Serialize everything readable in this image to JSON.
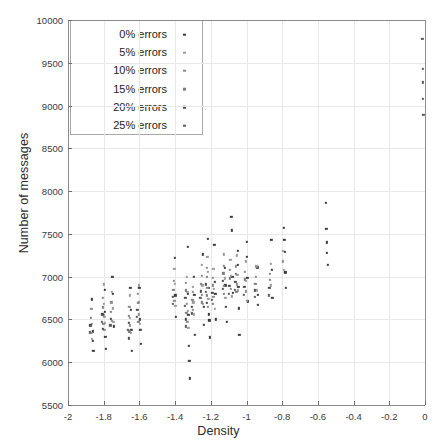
{
  "chart_data": {
    "type": "scatter",
    "title": "",
    "xlabel": "Density",
    "ylabel": "Number of messages",
    "xlim": [
      -2,
      0
    ],
    "ylim": [
      5500,
      10000
    ],
    "xticks": [
      "-2",
      "-1.8",
      "-1.6",
      "-1.4",
      "-1.2",
      "-1",
      "-0.8",
      "-0.6",
      "-0.4",
      "-0.2",
      "0"
    ],
    "xtick_values": [
      -2,
      -1.8,
      -1.6,
      -1.4,
      -1.2,
      -1,
      -0.8,
      -0.6,
      -0.4,
      -0.2,
      0
    ],
    "yticks": [
      "5500",
      "6000",
      "6500",
      "7000",
      "7500",
      "8000",
      "8500",
      "9000",
      "9500",
      "10000"
    ],
    "ytick_values": [
      5500,
      6000,
      6500,
      7000,
      7500,
      8000,
      8500,
      9000,
      9500,
      10000
    ],
    "grid": true,
    "legend_position": "upper-left",
    "legend_entries": [
      {
        "label": "0% errors",
        "color": "#3b3b3b"
      },
      {
        "label": "5% errors",
        "color": "#9a9a9a"
      },
      {
        "label": "10% errors",
        "color": "#8a8a8a"
      },
      {
        "label": "15% errors",
        "color": "#7d7d7d"
      },
      {
        "label": "20% errors",
        "color": "#4a4a4a"
      },
      {
        "label": "25% errors",
        "color": "#5a5a5a"
      }
    ],
    "series": [
      {
        "name": "0% errors",
        "color": "#3b3b3b",
        "points": [
          [
            -1.865,
            6735
          ],
          [
            -1.862,
            6360
          ],
          [
            -1.86,
            6250
          ],
          [
            -1.858,
            6130
          ],
          [
            -1.795,
            6845
          ],
          [
            -1.792,
            6590
          ],
          [
            -1.79,
            6300
          ],
          [
            -1.788,
            6155
          ],
          [
            -1.752,
            7000
          ],
          [
            -1.748,
            6800
          ],
          [
            -1.745,
            6420
          ],
          [
            -1.65,
            6870
          ],
          [
            -1.648,
            6610
          ],
          [
            -1.645,
            6380
          ],
          [
            -1.642,
            6130
          ],
          [
            -1.6,
            6870
          ],
          [
            -1.598,
            6500
          ],
          [
            -1.595,
            6380
          ],
          [
            -1.592,
            6215
          ],
          [
            -1.4,
            7220
          ],
          [
            -1.398,
            6780
          ],
          [
            -1.395,
            6530
          ],
          [
            -1.33,
            7350
          ],
          [
            -1.328,
            6800
          ],
          [
            -1.325,
            6550
          ],
          [
            -1.322,
            6195
          ],
          [
            -1.32,
            6020
          ],
          [
            -1.318,
            5810
          ],
          [
            -1.295,
            7000
          ],
          [
            -1.292,
            6790
          ],
          [
            -1.29,
            6320
          ],
          [
            -1.245,
            7260
          ],
          [
            -1.24,
            6650
          ],
          [
            -1.238,
            6440
          ],
          [
            -1.215,
            7440
          ],
          [
            -1.212,
            6870
          ],
          [
            -1.21,
            6560
          ],
          [
            -1.208,
            6490
          ],
          [
            -1.205,
            6290
          ],
          [
            -1.18,
            7370
          ],
          [
            -1.178,
            6940
          ],
          [
            -1.175,
            6800
          ],
          [
            -1.172,
            6500
          ],
          [
            -1.12,
            7100
          ],
          [
            -1.118,
            6900
          ],
          [
            -1.115,
            6650
          ],
          [
            -1.112,
            6470
          ],
          [
            -1.085,
            7700
          ],
          [
            -1.082,
            7540
          ],
          [
            -1.08,
            7000
          ],
          [
            -1.078,
            6810
          ],
          [
            -1.05,
            7300
          ],
          [
            -1.048,
            7140
          ],
          [
            -1.045,
            6880
          ],
          [
            -1.042,
            6630
          ],
          [
            -1.04,
            6320
          ],
          [
            -1.0,
            7410
          ],
          [
            -0.998,
            7230
          ],
          [
            -0.995,
            6990
          ],
          [
            -0.992,
            6710
          ],
          [
            -0.94,
            7110
          ],
          [
            -0.938,
            6790
          ],
          [
            -0.935,
            6670
          ],
          [
            -0.86,
            7430
          ],
          [
            -0.858,
            7080
          ],
          [
            -0.855,
            6750
          ],
          [
            -0.79,
            7570
          ],
          [
            -0.788,
            7430
          ],
          [
            -0.785,
            7290
          ],
          [
            -0.782,
            7050
          ],
          [
            -0.78,
            6870
          ],
          [
            -0.555,
            7860
          ],
          [
            -0.552,
            7560
          ],
          [
            -0.55,
            7400
          ],
          [
            -0.548,
            7280
          ],
          [
            -0.545,
            7140
          ]
        ]
      },
      {
        "name": "5% errors",
        "color": "#9a9a9a",
        "points": [
          [
            -1.868,
            6450
          ],
          [
            -1.866,
            6270
          ],
          [
            -1.8,
            6910
          ],
          [
            -1.798,
            6680
          ],
          [
            -1.796,
            6530
          ],
          [
            -1.794,
            6460
          ],
          [
            -1.755,
            6820
          ],
          [
            -1.75,
            6630
          ],
          [
            -1.746,
            6470
          ],
          [
            -1.655,
            6780
          ],
          [
            -1.652,
            6520
          ],
          [
            -1.649,
            6340
          ],
          [
            -1.605,
            6900
          ],
          [
            -1.602,
            6700
          ],
          [
            -1.599,
            6450
          ],
          [
            -1.405,
            7090
          ],
          [
            -1.402,
            6920
          ],
          [
            -1.399,
            6660
          ],
          [
            -1.335,
            7000
          ],
          [
            -1.332,
            6820
          ],
          [
            -1.329,
            6600
          ],
          [
            -1.326,
            6400
          ],
          [
            -1.3,
            6880
          ],
          [
            -1.297,
            6700
          ],
          [
            -1.294,
            6560
          ],
          [
            -1.25,
            7140
          ],
          [
            -1.247,
            6900
          ],
          [
            -1.244,
            6680
          ],
          [
            -1.22,
            7230
          ],
          [
            -1.217,
            7060
          ],
          [
            -1.214,
            6740
          ],
          [
            -1.185,
            7090
          ],
          [
            -1.182,
            6860
          ],
          [
            -1.179,
            6620
          ],
          [
            -1.125,
            7260
          ],
          [
            -1.122,
            6980
          ],
          [
            -1.119,
            6750
          ],
          [
            -1.09,
            7200
          ],
          [
            -1.087,
            7010
          ],
          [
            -1.084,
            6770
          ],
          [
            -1.055,
            7250
          ],
          [
            -1.052,
            7020
          ],
          [
            -1.049,
            6840
          ],
          [
            -1.005,
            7180
          ],
          [
            -1.002,
            6950
          ],
          [
            -0.999,
            6720
          ],
          [
            -0.945,
            7120
          ],
          [
            -0.942,
            6840
          ],
          [
            -0.865,
            7150
          ],
          [
            -0.862,
            6900
          ],
          [
            -0.795,
            7300
          ],
          [
            -0.792,
            7080
          ]
        ]
      },
      {
        "name": "10% errors",
        "color": "#8a8a8a",
        "points": [
          [
            -1.87,
            6620
          ],
          [
            -1.867,
            6340
          ],
          [
            -1.803,
            6750
          ],
          [
            -1.8,
            6550
          ],
          [
            -1.797,
            6380
          ],
          [
            -1.757,
            6700
          ],
          [
            -1.753,
            6480
          ],
          [
            -1.657,
            6650
          ],
          [
            -1.654,
            6430
          ],
          [
            -1.607,
            6800
          ],
          [
            -1.604,
            6560
          ],
          [
            -1.408,
            6950
          ],
          [
            -1.405,
            6720
          ],
          [
            -1.338,
            6930
          ],
          [
            -1.335,
            6680
          ],
          [
            -1.331,
            6470
          ],
          [
            -1.302,
            6820
          ],
          [
            -1.299,
            6610
          ],
          [
            -1.252,
            7010
          ],
          [
            -1.249,
            6790
          ],
          [
            -1.222,
            7100
          ],
          [
            -1.219,
            6870
          ],
          [
            -1.216,
            6650
          ],
          [
            -1.188,
            6990
          ],
          [
            -1.185,
            6760
          ],
          [
            -1.128,
            7130
          ],
          [
            -1.125,
            6890
          ],
          [
            -1.092,
            7080
          ],
          [
            -1.089,
            6860
          ],
          [
            -1.058,
            7120
          ],
          [
            -1.055,
            6910
          ],
          [
            -1.008,
            7060
          ],
          [
            -1.005,
            6830
          ],
          [
            -0.948,
            7000
          ],
          [
            -0.868,
            7030
          ],
          [
            -0.798,
            7180
          ]
        ]
      },
      {
        "name": "15% errors",
        "color": "#7d7d7d",
        "points": [
          [
            -1.872,
            6520
          ],
          [
            -1.805,
            6640
          ],
          [
            -1.802,
            6450
          ],
          [
            -1.759,
            6590
          ],
          [
            -1.659,
            6540
          ],
          [
            -1.656,
            6360
          ],
          [
            -1.609,
            6690
          ],
          [
            -1.606,
            6470
          ],
          [
            -1.41,
            6850
          ],
          [
            -1.34,
            6840
          ],
          [
            -1.337,
            6580
          ],
          [
            -1.304,
            6730
          ],
          [
            -1.254,
            6920
          ],
          [
            -1.251,
            6700
          ],
          [
            -1.224,
            7000
          ],
          [
            -1.221,
            6780
          ],
          [
            -1.19,
            6900
          ],
          [
            -1.187,
            6680
          ],
          [
            -1.13,
            7040
          ],
          [
            -1.127,
            6800
          ],
          [
            -1.094,
            6980
          ],
          [
            -1.06,
            7030
          ],
          [
            -1.057,
            6820
          ],
          [
            -1.01,
            6970
          ],
          [
            -0.95,
            6920
          ],
          [
            -0.87,
            6960
          ]
        ]
      },
      {
        "name": "20% errors",
        "color": "#4a4a4a",
        "points": [
          [
            -1.874,
            6430
          ],
          [
            -1.807,
            6560
          ],
          [
            -1.804,
            6390
          ],
          [
            -1.761,
            6510
          ],
          [
            -1.661,
            6460
          ],
          [
            -1.658,
            6280
          ],
          [
            -1.611,
            6610
          ],
          [
            -1.412,
            6760
          ],
          [
            -1.342,
            6750
          ],
          [
            -1.339,
            6500
          ],
          [
            -1.306,
            6650
          ],
          [
            -1.256,
            6830
          ],
          [
            -1.226,
            6910
          ],
          [
            -1.223,
            6690
          ],
          [
            -1.192,
            6810
          ],
          [
            -1.132,
            6950
          ],
          [
            -1.096,
            6890
          ],
          [
            -1.062,
            6940
          ],
          [
            -1.012,
            6880
          ],
          [
            -0.952,
            6840
          ],
          [
            -0.872,
            6870
          ]
        ]
      },
      {
        "name": "25% errors",
        "color": "#5a5a5a",
        "points": [
          [
            -1.876,
            6350
          ],
          [
            -1.809,
            6470
          ],
          [
            -1.763,
            6430
          ],
          [
            -1.663,
            6380
          ],
          [
            -1.613,
            6530
          ],
          [
            -1.414,
            6680
          ],
          [
            -1.344,
            6660
          ],
          [
            -1.341,
            6420
          ],
          [
            -1.308,
            6570
          ],
          [
            -1.258,
            6750
          ],
          [
            -1.228,
            6820
          ],
          [
            -1.194,
            6730
          ],
          [
            -1.134,
            6860
          ],
          [
            -1.098,
            6800
          ],
          [
            -1.064,
            6850
          ],
          [
            -1.014,
            6790
          ],
          [
            -0.954,
            6760
          ],
          [
            -0.874,
            6780
          ],
          [
            -0.015,
            9780
          ],
          [
            -0.013,
            9430
          ],
          [
            -0.012,
            9270
          ],
          [
            -0.011,
            9080
          ],
          [
            -0.01,
            8890
          ]
        ]
      }
    ]
  },
  "plot_geometry": {
    "left": 68,
    "right": 425,
    "top": 20,
    "bottom": 405
  },
  "legend_geometry": {
    "left": 70,
    "top": 20,
    "width": 133,
    "height": 115
  }
}
